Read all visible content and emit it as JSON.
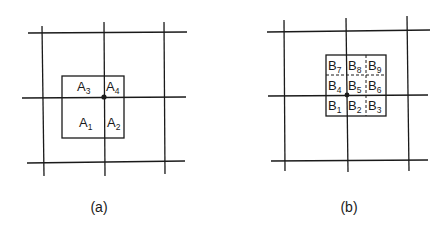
{
  "figure": {
    "panels": [
      {
        "caption": "(a)",
        "cells": [
          {
            "letter": "A",
            "sub": "3"
          },
          {
            "letter": "A",
            "sub": "4"
          },
          {
            "letter": "A",
            "sub": "1"
          },
          {
            "letter": "A",
            "sub": "2"
          }
        ]
      },
      {
        "caption": "(b)",
        "cells": [
          {
            "letter": "B",
            "sub": "7"
          },
          {
            "letter": "B",
            "sub": "8"
          },
          {
            "letter": "B",
            "sub": "9"
          },
          {
            "letter": "B",
            "sub": "4"
          },
          {
            "letter": "B",
            "sub": "5"
          },
          {
            "letter": "B",
            "sub": "6"
          },
          {
            "letter": "B",
            "sub": "1"
          },
          {
            "letter": "B",
            "sub": "2"
          },
          {
            "letter": "B",
            "sub": "3"
          }
        ]
      }
    ]
  }
}
